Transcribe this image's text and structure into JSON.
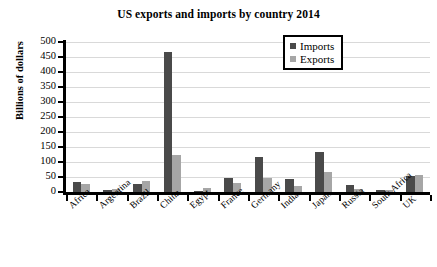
{
  "chart_data": {
    "type": "bar",
    "title": "US exports and imports by country 2014",
    "xlabel": "",
    "ylabel": "Billions of dollars",
    "ylim": [
      0,
      500
    ],
    "ytick_step": 50,
    "yticks": [
      500,
      450,
      400,
      350,
      300,
      250,
      200,
      150,
      100,
      50,
      0
    ],
    "grid": true,
    "legend_position": "top-right",
    "categories": [
      "Africa",
      "Argentina",
      "Brazil",
      "China",
      "Egypt",
      "France",
      "Germany",
      "India",
      "Japan",
      "Russia",
      "South Africa",
      "UK"
    ],
    "series": [
      {
        "name": "Imports",
        "color": "#4a4a4a",
        "values": [
          33,
          7,
          27,
          466,
          2,
          47,
          118,
          45,
          133,
          23,
          8,
          54
        ]
      },
      {
        "name": "Exports",
        "color": "#a6a6a6",
        "values": [
          27,
          11,
          36,
          124,
          15,
          31,
          47,
          21,
          67,
          11,
          6,
          56
        ]
      }
    ]
  },
  "legend": {
    "entries": [
      {
        "label": "Imports",
        "color": "#4a4a4a"
      },
      {
        "label": "Exports",
        "color": "#a6a6a6"
      }
    ]
  }
}
